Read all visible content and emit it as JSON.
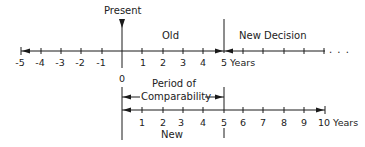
{
  "labels": {
    "present": "Present",
    "old": "Old",
    "new_decision": "New Decision",
    "five_years": "5 Years",
    "zero": "0",
    "period_line1": "Period of",
    "period_line2": "Comparability",
    "new": "New",
    "ten_years": "10 Years",
    "ellipsis": ". . ."
  },
  "top_axis": {
    "ticks": [
      "-5",
      "-4",
      "-3",
      "-2",
      "-1",
      "1",
      "2",
      "3",
      "4"
    ]
  },
  "bottom_axis": {
    "ticks": [
      "1",
      "2",
      "3",
      "4",
      "5",
      "6",
      "7",
      "8",
      "9"
    ]
  },
  "colors": {
    "line": "#1a1a1a",
    "background": "#ffffff"
  }
}
